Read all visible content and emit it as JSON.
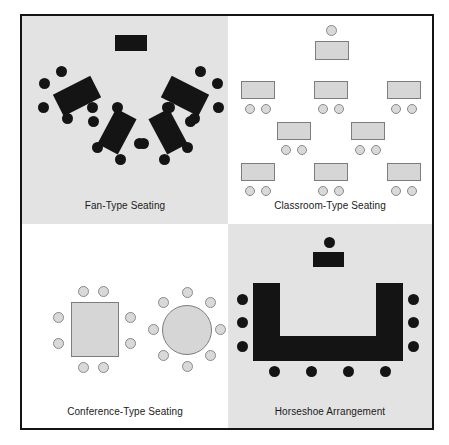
{
  "figure": {
    "border_color": "#141414",
    "panel_shade_color": "#e3e3e3",
    "panel_light_color": "#ffffff",
    "dark_element_color": "#141414",
    "light_element_fill": "#d6d6d6",
    "light_element_stroke": "#7d7d7d"
  },
  "panels": [
    {
      "id": "fan-type",
      "caption": "Fan-Type Seating",
      "background": "shaded",
      "instructor_desk_count": 1,
      "table_count": 4,
      "chairs_per_table": 5,
      "tables": [
        {
          "label": "table-left-outer",
          "x": 22,
          "y": 60,
          "w": 40,
          "h": 22,
          "rotation": -27,
          "chairs": 5
        },
        {
          "label": "table-left-inner",
          "x": 70,
          "y": 92,
          "w": 40,
          "h": 22,
          "rotation": -62,
          "chairs": 5
        },
        {
          "label": "table-right-inner",
          "x": 122,
          "y": 92,
          "w": 40,
          "h": 22,
          "rotation": 62,
          "chairs": 5
        },
        {
          "label": "table-right-outer",
          "x": 148,
          "y": 60,
          "w": 40,
          "h": 22,
          "rotation": 27,
          "chairs": 5
        }
      ]
    },
    {
      "id": "classroom-type",
      "caption": "Classroom-Type Seating",
      "background": "plain",
      "instructor_desk_count": 1,
      "instructor_chairs": 1,
      "student_desk_count": 8,
      "chairs_per_student_desk": 2,
      "rows": [
        {
          "label": "instructor-row",
          "desks": 1
        },
        {
          "label": "row-1",
          "desks": 3
        },
        {
          "label": "row-2",
          "desks": 2
        },
        {
          "label": "row-3",
          "desks": 3
        }
      ]
    },
    {
      "id": "conference-type",
      "caption": "Conference-Type Seating",
      "background": "plain",
      "tables": [
        {
          "label": "rectangular-table",
          "shape": "rectangle",
          "chairs": 8
        },
        {
          "label": "round-table",
          "shape": "circle",
          "chairs": 8
        }
      ]
    },
    {
      "id": "horseshoe",
      "caption": "Horseshoe Arrangement",
      "background": "shaded",
      "instructor_desk_count": 1,
      "instructor_chairs": 1,
      "chairs_left": 3,
      "chairs_right": 3,
      "chairs_bottom": 4,
      "total_participant_chairs": 10
    }
  ]
}
